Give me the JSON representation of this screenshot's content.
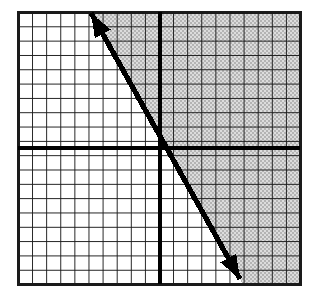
{
  "figure": {
    "width": 314,
    "height": 286,
    "background_color": "#ffffff"
  },
  "grid": {
    "left": 18,
    "top": 12,
    "right": 300,
    "bottom": 284,
    "cell_width": 14.1,
    "cell_height": 14.32,
    "columns": 20,
    "rows": 19,
    "line_color": "#1a1a1a",
    "minor_line_width": 2.0,
    "fill_color": "#ffffff"
  },
  "axes": {
    "x_axis_y": 148,
    "y_axis_x": 160,
    "axis_color": "#000000",
    "axis_line_width": 3.4,
    "x_axis_label": "",
    "y_axis_label": "",
    "tick_labels_visible": false
  },
  "shading": {
    "region": "right-of-line",
    "pattern": "stipple",
    "color": "#b4b4b4",
    "base_color": "#dcdcdc",
    "description": "Shaded half-plane above and to the right of the boundary line"
  },
  "boundary_line": {
    "style": "solid",
    "color": "#000000",
    "stroke_width": 5.2,
    "arrowheads": "both",
    "start_point": {
      "x": 91,
      "y": 13
    },
    "end_point": {
      "x": 240,
      "y": 279
    },
    "slope_pixels": -1.785,
    "slope_grid_units": -2.0
  },
  "chart_data": {
    "type": "line",
    "title": "",
    "xlabel": "",
    "ylabel": "",
    "grid": true,
    "legend": "none",
    "xlim": [
      -10,
      10
    ],
    "ylim": [
      -9.5,
      9.5
    ],
    "series": [
      {
        "name": "boundary-line",
        "style": "solid",
        "arrowheads": "both",
        "x": [
          -4.9,
          5.6
        ],
        "y": [
          9.4,
          -9.2
        ],
        "slope": -2.0,
        "intercept": -0.5
      }
    ],
    "shaded_regions": [
      {
        "name": "solution-region",
        "side": "above-right",
        "fill": "stipple-gray"
      }
    ]
  }
}
